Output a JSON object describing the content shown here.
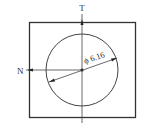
{
  "diagram": {
    "labels": {
      "top": "T",
      "left": "N",
      "diameter": "ϕ 6.16"
    },
    "colors": {
      "stroke": "#333333",
      "background": "#ffffff"
    }
  }
}
